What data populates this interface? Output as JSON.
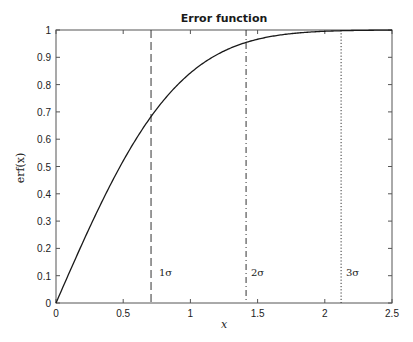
{
  "chart_data": {
    "type": "line",
    "title": "Error function",
    "xlabel": "x",
    "ylabel": "erf(x)",
    "xlim": [
      0,
      2.5
    ],
    "ylim": [
      0,
      1
    ],
    "grid": false,
    "x_ticks": [
      0,
      0.5,
      1,
      1.5,
      2,
      2.5
    ],
    "x_tick_labels": [
      "0",
      "0.5",
      "1",
      "1.5",
      "2",
      "2.5"
    ],
    "y_ticks": [
      0,
      0.1,
      0.2,
      0.3,
      0.4,
      0.5,
      0.6,
      0.7,
      0.8,
      0.9,
      1
    ],
    "y_tick_labels": [
      "0",
      "0.1",
      "0.2",
      "0.3",
      "0.4",
      "0.5",
      "0.6",
      "0.7",
      "0.8",
      "0.9",
      "1"
    ],
    "series": [
      {
        "name": "erf(x)",
        "style": "solid",
        "x": [
          0,
          0.1,
          0.2,
          0.3,
          0.4,
          0.5,
          0.6,
          0.7,
          0.8,
          0.9,
          1.0,
          1.1,
          1.2,
          1.3,
          1.4,
          1.5,
          1.6,
          1.7,
          1.8,
          1.9,
          2.0,
          2.1,
          2.2,
          2.3,
          2.4,
          2.5
        ],
        "values": [
          0,
          0.1125,
          0.2227,
          0.3286,
          0.4284,
          0.5205,
          0.6039,
          0.6778,
          0.7421,
          0.7969,
          0.8427,
          0.8802,
          0.9103,
          0.934,
          0.9523,
          0.9661,
          0.9763,
          0.9838,
          0.9891,
          0.9928,
          0.9953,
          0.997,
          0.9981,
          0.9989,
          0.9993,
          0.9996
        ]
      }
    ],
    "vertical_lines": [
      {
        "x": 0.7071,
        "style": "dashed",
        "label": "1σ"
      },
      {
        "x": 1.4142,
        "style": "dashdot",
        "label": "2σ"
      },
      {
        "x": 2.1213,
        "style": "dotted",
        "label": "3σ"
      }
    ]
  },
  "labels": {
    "title": "Error function",
    "xlabel": "x",
    "ylabel": "erf(x)",
    "sigma1": "1σ",
    "sigma2": "2σ",
    "sigma3": "3σ"
  }
}
